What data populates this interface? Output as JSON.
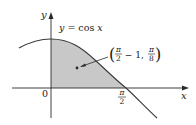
{
  "figure": {
    "type": "function-plot",
    "function_label": "y = cos x",
    "function_label_parts": {
      "lhs": "y",
      "eq": " = cos ",
      "var": "x"
    },
    "axes": {
      "x_label": "x",
      "y_label": "y",
      "origin_label": "0",
      "x_tick": {
        "num": "π",
        "den": "2"
      }
    },
    "shaded_region": "area under y = cos x from x = 0 to x = π/2",
    "centroid_label": {
      "open": "(",
      "frac1_num": "π",
      "frac1_den": "2",
      "minus_one": " − 1, ",
      "frac2_num": "π",
      "frac2_den": "8",
      "close": ")"
    },
    "colors": {
      "shade": "#c8c8c8",
      "curve": "#3a3a3a",
      "axis": "#2a2a2a"
    }
  }
}
